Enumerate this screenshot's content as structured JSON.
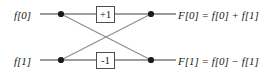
{
  "figure": {
    "type": "signal-flow-graph",
    "width": 280,
    "height": 75,
    "background_color": "#ffffff",
    "line_color": "#808080",
    "diagonal_color": "#8c8c8c",
    "node_color": "#1a1a1a",
    "box_border_color": "#4d4d4d",
    "text_color": "#1a1a1a"
  },
  "inputs": [
    {
      "id": "in-0",
      "label": "f[0]",
      "row": "top"
    },
    {
      "id": "in-1",
      "label": "f[1]",
      "row": "bottom"
    }
  ],
  "gains": [
    {
      "id": "gain-plus",
      "label": "+1",
      "row": "top"
    },
    {
      "id": "gain-minus",
      "label": "-1",
      "row": "bottom"
    }
  ],
  "outputs": [
    {
      "id": "out-0",
      "label": "F[0] = f[0] + f[1]",
      "row": "top"
    },
    {
      "id": "out-1",
      "label": "F[1] = f[0] − f[1]",
      "row": "bottom"
    }
  ],
  "nodes": [
    {
      "id": "node-in-top",
      "x": 61,
      "y": 14
    },
    {
      "id": "node-in-bot",
      "x": 61,
      "y": 60
    },
    {
      "id": "node-out-top",
      "x": 151,
      "y": 14
    },
    {
      "id": "node-out-bot",
      "x": 151,
      "y": 60
    }
  ],
  "edges": [
    {
      "id": "edge-in-top-straight",
      "from": "in-0",
      "to": "node-in-top"
    },
    {
      "id": "edge-top-through-gain",
      "from": "node-in-top",
      "to": "node-out-top"
    },
    {
      "id": "edge-in-bot-straight",
      "from": "in-1",
      "to": "node-in-bot"
    },
    {
      "id": "edge-bot-through-gain",
      "from": "node-in-bot",
      "to": "node-out-bot"
    },
    {
      "id": "edge-cross-down",
      "from": "node-in-top",
      "to": "node-out-bot"
    },
    {
      "id": "edge-cross-up",
      "from": "node-in-bot",
      "to": "node-out-top"
    },
    {
      "id": "edge-out-top",
      "from": "node-out-top",
      "to": "out-0"
    },
    {
      "id": "edge-out-bot",
      "from": "node-out-bot",
      "to": "out-1"
    }
  ]
}
